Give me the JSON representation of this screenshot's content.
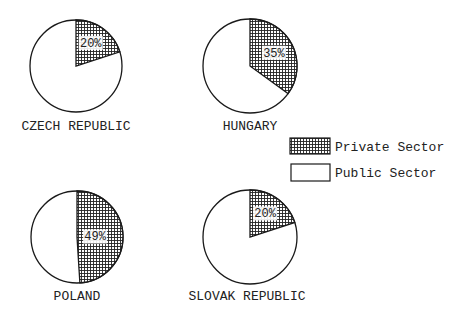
{
  "chart_data": {
    "type": "pie",
    "title": "",
    "legend": {
      "position": "right",
      "entries": [
        {
          "label": "Private Sector",
          "fill": "crosshatch"
        },
        {
          "label": "Public Sector",
          "fill": "#ffffff"
        }
      ]
    },
    "charts": [
      {
        "country": "CZECH REPUBLIC",
        "private_pct": 20,
        "public_pct": 80,
        "private_label": "20%"
      },
      {
        "country": "HUNGARY",
        "private_pct": 35,
        "public_pct": 65,
        "private_label": "35%"
      },
      {
        "country": "POLAND",
        "private_pct": 49,
        "public_pct": 51,
        "private_label": "49%"
      },
      {
        "country": "SLOVAK REPUBLIC",
        "private_pct": 20,
        "public_pct": 80,
        "private_label": "20%"
      }
    ]
  },
  "layout": {
    "pies": [
      {
        "cx": 76,
        "cy": 66,
        "r": 46,
        "label_x": 76,
        "label_y": 130
      },
      {
        "cx": 250,
        "cy": 66,
        "r": 47,
        "label_x": 250,
        "label_y": 130
      },
      {
        "cx": 77,
        "cy": 237,
        "r": 46,
        "label_x": 77,
        "label_y": 300
      },
      {
        "cx": 250,
        "cy": 237,
        "r": 47,
        "label_x": 247,
        "label_y": 300
      }
    ]
  },
  "colors": {
    "stroke": "#1a1a1a",
    "hatch": "#222222",
    "background": "#ffffff"
  }
}
